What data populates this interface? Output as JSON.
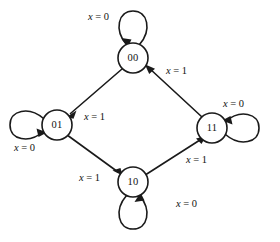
{
  "figure": {
    "type": "state-transition-diagram",
    "background_color": "#ffffff",
    "stroke_color": "#1a1a1a",
    "text_color": "#111111",
    "width": 280,
    "height": 242
  },
  "states": [
    {
      "id": "s00",
      "label": "00",
      "cx": 133,
      "cy": 58,
      "r": 15
    },
    {
      "id": "s01",
      "label": "01",
      "cx": 57,
      "cy": 125,
      "r": 15
    },
    {
      "id": "s11",
      "label": "11",
      "cx": 212,
      "cy": 128,
      "r": 15
    },
    {
      "id": "s10",
      "label": "10",
      "cx": 133,
      "cy": 182,
      "r": 15
    }
  ],
  "transitions": [
    {
      "id": "t00-01",
      "from": "00",
      "to": "01",
      "label_var": "x",
      "label_eq": "=",
      "label_val": "0",
      "label": "x = 1",
      "value": "1",
      "label_x": 84,
      "label_y": 112
    },
    {
      "id": "t01-10",
      "from": "01",
      "to": "10",
      "label": "x = 1",
      "value": "1",
      "label_x": 79,
      "label_y": 173
    },
    {
      "id": "t10-11",
      "from": "10",
      "to": "11",
      "label": "x = 1",
      "value": "1",
      "label_x": 186,
      "label_y": 155
    },
    {
      "id": "t11-00",
      "from": "11",
      "to": "00",
      "label": "x = 1",
      "value": "1",
      "label_x": 166,
      "label_y": 66
    }
  ],
  "self_loops": [
    {
      "id": "l00",
      "state": "00",
      "label": "x = 0",
      "value": "0",
      "position": "top",
      "label_x": 88,
      "label_y": 12
    },
    {
      "id": "l01",
      "state": "01",
      "label": "x = 0",
      "value": "0",
      "position": "left",
      "label_x": 14,
      "label_y": 143
    },
    {
      "id": "l11",
      "state": "11",
      "label": "x = 0",
      "value": "0",
      "position": "right",
      "label_x": 223,
      "label_y": 99
    },
    {
      "id": "l10",
      "state": "10",
      "label": "x = 0",
      "value": "0",
      "position": "bottom",
      "label_x": 176,
      "label_y": 199
    }
  ],
  "labels": {
    "input_variable": "x",
    "equals": "=",
    "value_zero": "0",
    "value_one": "1",
    "text_x_equals_0": "x = 0",
    "text_x_equals_1": "x = 1"
  }
}
